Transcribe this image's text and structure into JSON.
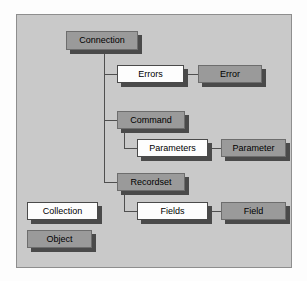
{
  "diagram": {
    "type": "hierarchy-tree",
    "legend_note": "White boxes denote Collections; gray boxes denote Objects",
    "colors": {
      "panel_background": "#c9c9c9",
      "object_fill": "#9a9a9a",
      "collection_fill": "#fdfdfd",
      "border": "#555555",
      "shadow": "#4a4a4a",
      "connector": "#4f4f4f",
      "text": "#000000"
    },
    "nodes": [
      {
        "id": "connection",
        "label": "Connection",
        "kind": "object"
      },
      {
        "id": "errors",
        "label": "Errors",
        "kind": "collection"
      },
      {
        "id": "error",
        "label": "Error",
        "kind": "object"
      },
      {
        "id": "command",
        "label": "Command",
        "kind": "object"
      },
      {
        "id": "parameters",
        "label": "Parameters",
        "kind": "collection"
      },
      {
        "id": "parameter",
        "label": "Parameter",
        "kind": "object"
      },
      {
        "id": "recordset",
        "label": "Recordset",
        "kind": "object"
      },
      {
        "id": "fields",
        "label": "Fields",
        "kind": "collection"
      },
      {
        "id": "field",
        "label": "Field",
        "kind": "object"
      }
    ],
    "legend": [
      {
        "id": "legend-collection",
        "label": "Collection",
        "kind": "collection"
      },
      {
        "id": "legend-object",
        "label": "Object",
        "kind": "object"
      }
    ],
    "edges": [
      {
        "from": "connection",
        "to": "errors"
      },
      {
        "from": "errors",
        "to": "error"
      },
      {
        "from": "connection",
        "to": "command"
      },
      {
        "from": "command",
        "to": "parameters"
      },
      {
        "from": "parameters",
        "to": "parameter"
      },
      {
        "from": "connection",
        "to": "recordset"
      },
      {
        "from": "recordset",
        "to": "fields"
      },
      {
        "from": "fields",
        "to": "field"
      }
    ]
  }
}
